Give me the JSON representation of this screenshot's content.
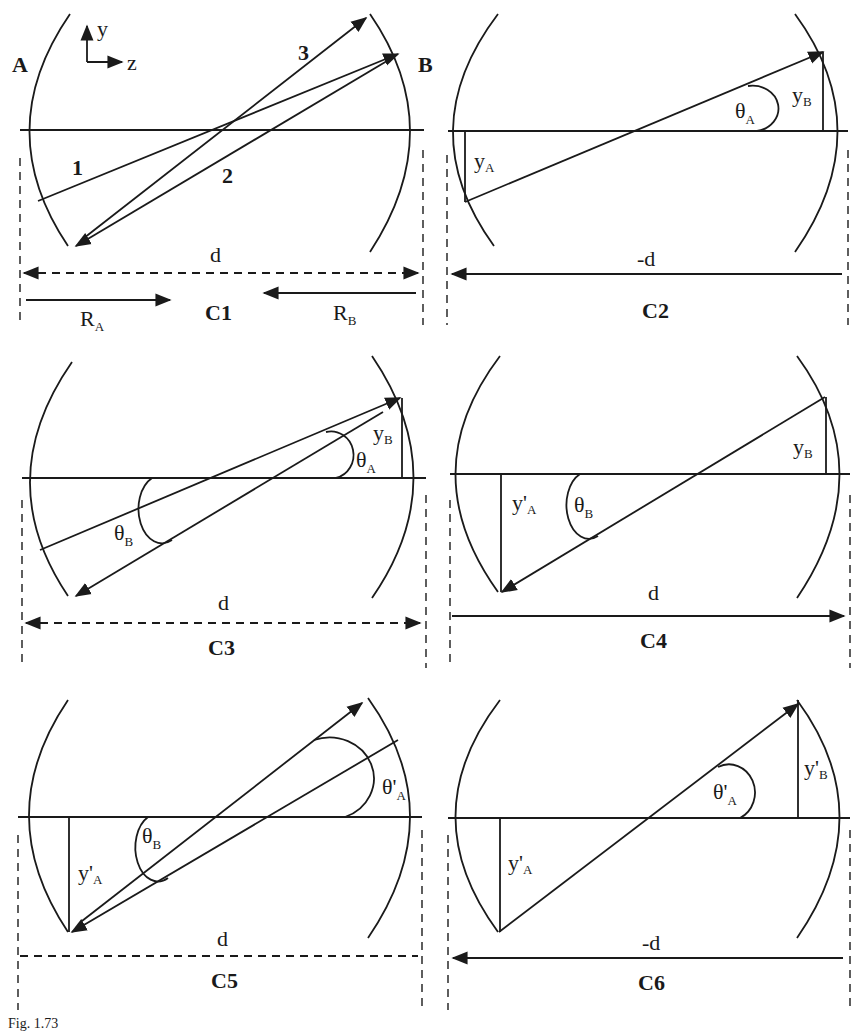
{
  "figure": {
    "caption": "Fig. 1.73",
    "axes": {
      "y_label": "y",
      "z_label": "z"
    },
    "mirror_labels": {
      "left": "A",
      "right": "B"
    }
  },
  "panels": [
    {
      "id": "C1",
      "title": "C1",
      "ray_labels": [
        "1",
        "2",
        "3"
      ],
      "distance_label": "d",
      "distance_arrow": "double-dashed",
      "radius_labels": {
        "left": "R",
        "left_sub": "A",
        "right": "R",
        "right_sub": "B"
      }
    },
    {
      "id": "C2",
      "title": "C2",
      "distance_label": "-d",
      "distance_arrow": "left-solid",
      "height_labels": [
        {
          "base": "y",
          "sub": "A",
          "prime": false
        },
        {
          "base": "y",
          "sub": "B",
          "prime": false
        }
      ],
      "angle_labels": [
        {
          "base": "θ",
          "sub": "A",
          "prime": false
        }
      ]
    },
    {
      "id": "C3",
      "title": "C3",
      "distance_label": "d",
      "distance_arrow": "double-dashed",
      "height_labels": [
        {
          "base": "y",
          "sub": "B",
          "prime": false
        }
      ],
      "angle_labels": [
        {
          "base": "θ",
          "sub": "A",
          "prime": false
        },
        {
          "base": "θ",
          "sub": "B",
          "prime": false
        }
      ]
    },
    {
      "id": "C4",
      "title": "C4",
      "distance_label": "d",
      "distance_arrow": "right-solid",
      "height_labels": [
        {
          "base": "y'",
          "sub": "A",
          "prime": true
        },
        {
          "base": "y",
          "sub": "B",
          "prime": false
        }
      ],
      "angle_labels": [
        {
          "base": "θ",
          "sub": "B",
          "prime": false
        }
      ]
    },
    {
      "id": "C5",
      "title": "C5",
      "distance_label": "d",
      "distance_arrow": "dashed-no-heads",
      "height_labels": [
        {
          "base": "y'",
          "sub": "A",
          "prime": true
        }
      ],
      "angle_labels": [
        {
          "base": "θ'",
          "sub": "A",
          "prime": true
        },
        {
          "base": "θ",
          "sub": "B",
          "prime": false
        }
      ]
    },
    {
      "id": "C6",
      "title": "C6",
      "distance_label": "-d",
      "distance_arrow": "left-solid",
      "height_labels": [
        {
          "base": "y'",
          "sub": "A",
          "prime": true
        },
        {
          "base": "y'",
          "sub": "B",
          "prime": true
        }
      ],
      "angle_labels": [
        {
          "base": "θ'",
          "sub": "A",
          "prime": true
        }
      ]
    }
  ],
  "colors": {
    "ink": "#1a1a1a",
    "background": "#ffffff"
  }
}
